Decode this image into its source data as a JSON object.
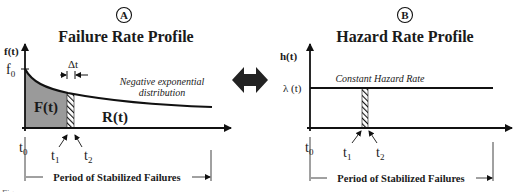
{
  "panel_a": {
    "badge": "A",
    "title": "Failure Rate Profile",
    "y_axis_label": "f(t)",
    "y_tick_label": "f",
    "y_tick_sub": "0",
    "delta_label": "Δt",
    "curve_annotation_line1": "Negative exponential",
    "curve_annotation_line2": "distribution",
    "region_left_label": "F(t)",
    "region_right_label": "R(t)",
    "x_labels": [
      {
        "base": "t",
        "sub": "0"
      },
      {
        "base": "t",
        "sub": "1"
      },
      {
        "base": "t",
        "sub": "2"
      }
    ],
    "period_label": "Period of Stabilized Failures"
  },
  "panel_b": {
    "badge": "B",
    "title": "Hazard Rate Profile",
    "y_axis_label": "h(t)",
    "y_tick_label": "λ (t)",
    "line_annotation": "Constant Hazard Rate",
    "x_labels": [
      {
        "base": "t",
        "sub": "0"
      },
      {
        "base": "t",
        "sub": "1"
      },
      {
        "base": "t",
        "sub": "2"
      }
    ],
    "period_label": "Period of Stabilized Failures"
  },
  "connector": {
    "icon": "double-arrow-icon"
  },
  "colors": {
    "stroke": "#111111",
    "shaded_area": "#9a9a9a",
    "background": "#ffffff"
  },
  "caption": "Figure ..."
}
